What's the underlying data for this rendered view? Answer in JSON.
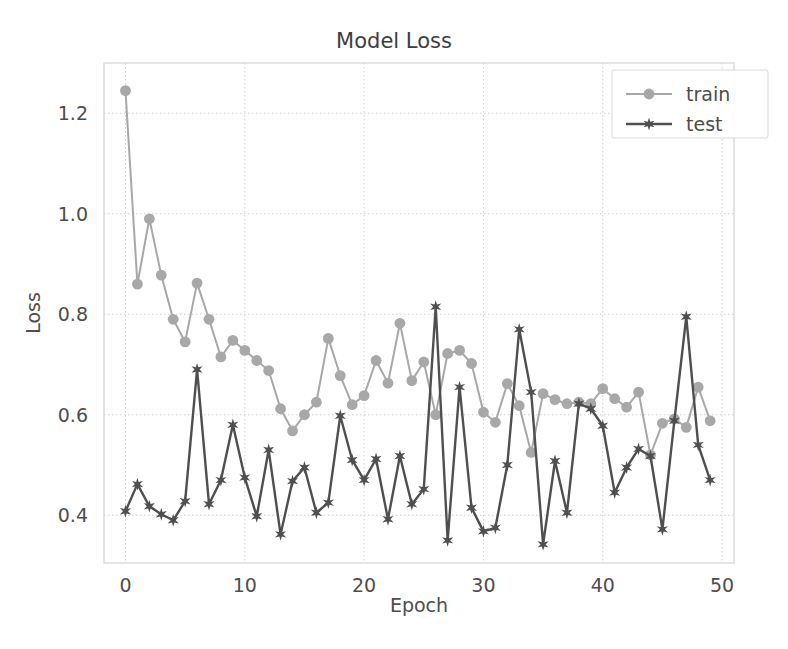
{
  "chart_data": {
    "type": "line",
    "title": "Model Loss",
    "xlabel": "Epoch",
    "ylabel": "Loss",
    "xlim": [
      -1.8,
      51
    ],
    "ylim": [
      0.305,
      1.3
    ],
    "grid": true,
    "legend_position": "upper right",
    "xticks": [
      0,
      10,
      20,
      30,
      40,
      50
    ],
    "xtick_labels": [
      "0",
      "10",
      "20",
      "30",
      "40",
      "50"
    ],
    "yticks": [
      0.4,
      0.6,
      0.8,
      1.0,
      1.2
    ],
    "ytick_labels": [
      "0.4",
      "0.6",
      "0.8",
      "1.0",
      "1.2"
    ],
    "x": [
      0,
      1,
      2,
      3,
      4,
      5,
      6,
      7,
      8,
      9,
      10,
      11,
      12,
      13,
      14,
      15,
      16,
      17,
      18,
      19,
      20,
      21,
      22,
      23,
      24,
      25,
      26,
      27,
      28,
      29,
      30,
      31,
      32,
      33,
      34,
      35,
      36,
      37,
      38,
      39,
      40,
      41,
      42,
      43,
      44,
      45,
      46,
      47,
      48,
      49
    ],
    "series": [
      {
        "name": "train",
        "color": "#a8a8a8",
        "marker": "circle",
        "values": [
          1.245,
          0.86,
          0.99,
          0.878,
          0.79,
          0.745,
          0.862,
          0.79,
          0.715,
          0.748,
          0.728,
          0.708,
          0.688,
          0.612,
          0.568,
          0.6,
          0.625,
          0.752,
          0.678,
          0.62,
          0.638,
          0.708,
          0.663,
          0.782,
          0.668,
          0.705,
          0.6,
          0.722,
          0.728,
          0.702,
          0.605,
          0.585,
          0.662,
          0.618,
          0.525,
          0.642,
          0.63,
          0.622,
          0.625,
          0.622,
          0.652,
          0.632,
          0.615,
          0.645,
          0.52,
          0.583,
          0.592,
          0.575,
          0.655,
          0.588
        ]
      },
      {
        "name": "test",
        "color": "#4f4f4f",
        "marker": "star",
        "values": [
          0.408,
          0.462,
          0.418,
          0.402,
          0.39,
          0.428,
          0.69,
          0.422,
          0.47,
          0.58,
          0.475,
          0.398,
          0.53,
          0.362,
          0.468,
          0.495,
          0.405,
          0.425,
          0.598,
          0.51,
          0.47,
          0.512,
          0.392,
          0.518,
          0.422,
          0.452,
          0.815,
          0.35,
          0.655,
          0.415,
          0.368,
          0.375,
          0.5,
          0.77,
          0.645,
          0.342,
          0.508,
          0.405,
          0.622,
          0.612,
          0.578,
          0.445,
          0.495,
          0.532,
          0.518,
          0.372,
          0.588,
          0.795,
          0.54,
          0.47
        ]
      }
    ]
  },
  "legend": {
    "entries": [
      {
        "label": "train"
      },
      {
        "label": "test"
      }
    ]
  }
}
